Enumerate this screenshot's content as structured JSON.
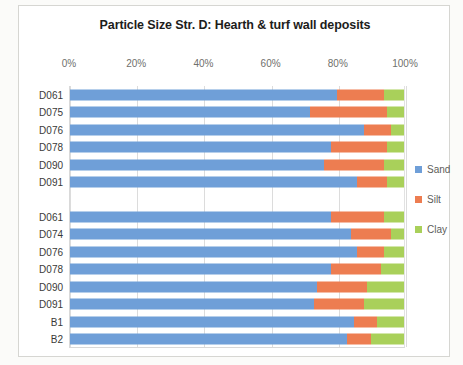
{
  "chart_data": {
    "type": "bar",
    "orientation": "horizontal",
    "stacked": true,
    "stacked_mode": "percent",
    "title": "Particle Size Str. D: Hearth & turf wall deposits",
    "xlabel": "",
    "ylabel": "",
    "xlim": [
      0,
      100
    ],
    "xticks": [
      0,
      20,
      40,
      60,
      80,
      100
    ],
    "xtick_labels": [
      "0%",
      "20%",
      "40%",
      "60%",
      "80%",
      "100%"
    ],
    "grid": true,
    "grid_axis": "x",
    "legend_position": "right",
    "categories": [
      "D061",
      "D075",
      "D076",
      "D078",
      "D090",
      "D091",
      "",
      "D061",
      "D074",
      "D076",
      "D078",
      "D090",
      "D091",
      "B1",
      "B2"
    ],
    "series": [
      {
        "name": "Sand",
        "color": "#6F9FD8",
        "values": [
          80,
          72,
          88,
          78,
          76,
          86,
          null,
          78,
          84,
          86,
          78,
          74,
          73,
          85,
          83
        ]
      },
      {
        "name": "Silt",
        "color": "#ED7D51",
        "values": [
          14,
          23,
          8,
          17,
          18,
          9,
          null,
          16,
          12,
          8,
          15,
          15,
          15,
          7,
          7
        ]
      },
      {
        "name": "Clay",
        "color": "#A9D05A",
        "values": [
          6,
          5,
          4,
          5,
          6,
          5,
          null,
          6,
          4,
          6,
          7,
          11,
          12,
          8,
          10
        ]
      }
    ]
  },
  "legend": {
    "items": [
      {
        "label": "Sand",
        "color": "#6F9FD8"
      },
      {
        "label": "Silt",
        "color": "#ED7D51"
      },
      {
        "label": "Clay",
        "color": "#A9D05A"
      }
    ]
  }
}
